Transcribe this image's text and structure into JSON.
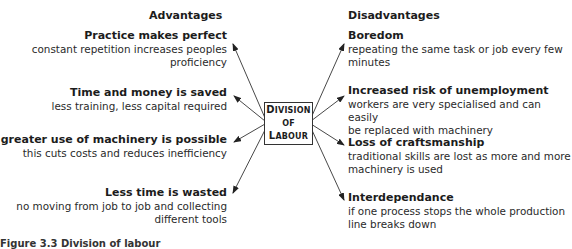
{
  "headers": {
    "advantages": "Advantages",
    "disadvantages": "Disadvantages"
  },
  "center": {
    "line1_first": "D",
    "line1_rest": "IVISION",
    "line2": "OF",
    "line3_first": "L",
    "line3_rest": "ABOUR"
  },
  "advantages": [
    {
      "title": "Practice makes perfect",
      "desc1": "constant repetition increases peoples",
      "desc2": "proficiency"
    },
    {
      "title": "Time and money is saved",
      "desc1": "less training, less capital required",
      "desc2": ""
    },
    {
      "title": "A greater use of machinery is possible",
      "desc1": "this cuts costs and reduces inefficiency",
      "desc2": ""
    },
    {
      "title": "Less time is wasted",
      "desc1": "no moving from job to job and collecting",
      "desc2": "different tools"
    }
  ],
  "disadvantages": [
    {
      "title": "Boredom",
      "desc1": "repeating the same task or job every few",
      "desc2": "minutes"
    },
    {
      "title": "Increased risk of unemployment",
      "desc1": "workers are very specialised  and can easily",
      "desc2": "be replaced with machinery"
    },
    {
      "title": "Loss of craftsmanship",
      "desc1": "traditional skills are lost as more and more",
      "desc2": "machinery is used"
    },
    {
      "title": "Interdependance",
      "desc1": "if one process stops the whole production",
      "desc2": "line breaks down"
    }
  ],
  "caption": "Figure 3.3  Division of labour"
}
